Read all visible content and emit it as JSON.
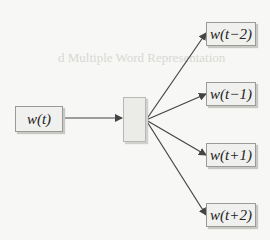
{
  "diagram": {
    "type": "skip-gram",
    "input": {
      "label": "w(t)"
    },
    "projection": {
      "label": ""
    },
    "outputs": [
      {
        "label": "w(t−2)"
      },
      {
        "label": "w(t−1)"
      },
      {
        "label": "w(t+1)"
      },
      {
        "label": "w(t+2)"
      }
    ]
  },
  "background_text": {
    "heading_fragment": "d Multiple Word Representation"
  },
  "colors": {
    "background": "#f7f7f5",
    "box_fill": "#f0f0ee",
    "box_border": "#9a9a96",
    "arrow": "#444444"
  }
}
